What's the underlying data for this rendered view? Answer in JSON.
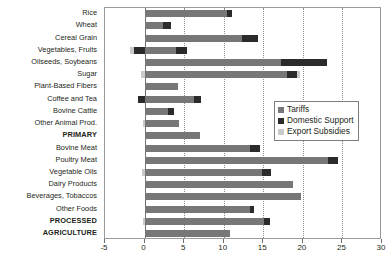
{
  "chart_data": {
    "type": "bar",
    "orientation": "horizontal",
    "stacked": true,
    "title": "",
    "xlabel": "",
    "ylabel": "",
    "xlim": [
      -5,
      30
    ],
    "xticks": [
      -5,
      0,
      5,
      10,
      15,
      20,
      25,
      30
    ],
    "xticklabels": [
      "-5",
      "0",
      "5",
      "10",
      "15",
      "20",
      "25",
      "30"
    ],
    "grid": "vertical-dotted",
    "legend_position": "right-middle",
    "legend": [
      {
        "name": "Tariffs",
        "color": "#777777"
      },
      {
        "name": "Domestic Support",
        "color": "#2b2b2b"
      },
      {
        "name": "Export Subsidies",
        "color": "#c9c9c9"
      }
    ],
    "categories": [
      "Rice",
      "Wheat",
      "Cereal Grain",
      "Vegetables, Fruits",
      "Oilseeds, Soybeans",
      "Sugar",
      "Plant-Based Fibers",
      "Coffee and Tea",
      "Bovine Cattle",
      "Other Animal Prod.",
      "PRIMARY",
      "Bovine Meat",
      "Poultry Meat",
      "Vegetable Oils",
      "Dairy Products",
      "Beverages, Tobaccos",
      "Other Foods",
      "PROCESSED",
      "AGRICULTURE"
    ],
    "emphasis_rows": [
      "PRIMARY",
      "PROCESSED",
      "AGRICULTURE"
    ],
    "series": [
      {
        "name": "Tariffs",
        "values": [
          10.4,
          2.3,
          12.3,
          4.0,
          17.2,
          18.0,
          4.2,
          6.3,
          3.0,
          4.3,
          7.0,
          13.3,
          23.2,
          14.8,
          18.7,
          19.8,
          13.3,
          15.1,
          10.8
        ]
      },
      {
        "name": "Domestic Support",
        "values": [
          0.6,
          1.1,
          2.0,
          1.4,
          5.8,
          1.2,
          0.0,
          0.8,
          0.7,
          0.0,
          0.0,
          1.3,
          1.3,
          1.2,
          0.0,
          0.0,
          0.5,
          0.7,
          0.0
        ]
      },
      {
        "name": "Export Subsidies",
        "values": [
          0.0,
          0.0,
          0.0,
          0.0,
          0.0,
          0.4,
          0.0,
          0.0,
          0.0,
          0.0,
          0.0,
          0.0,
          0.0,
          0.0,
          0.0,
          0.0,
          0.0,
          0.0,
          0.0
        ]
      }
    ],
    "negative_starts": [
      {
        "category": "Vegetables, Fruits",
        "series": "Export Subsidies",
        "from": -1.8,
        "to": -1.3
      },
      {
        "category": "Vegetables, Fruits",
        "series": "Domestic Support",
        "from": -1.3,
        "to": 0.0
      },
      {
        "category": "Sugar",
        "series": "Export Subsidies",
        "from": -0.5,
        "to": 0.0
      },
      {
        "category": "Coffee and Tea",
        "series": "Domestic Support",
        "from": -0.8,
        "to": 0.0
      },
      {
        "category": "Other Animal Prod.",
        "series": "Export Subsidies",
        "from": -0.2,
        "to": 0.0
      },
      {
        "category": "Vegetable Oils",
        "series": "Export Subsidies",
        "from": -0.3,
        "to": 0.0
      },
      {
        "category": "PROCESSED",
        "series": "Export Subsidies",
        "from": -0.2,
        "to": 0.0
      }
    ]
  }
}
